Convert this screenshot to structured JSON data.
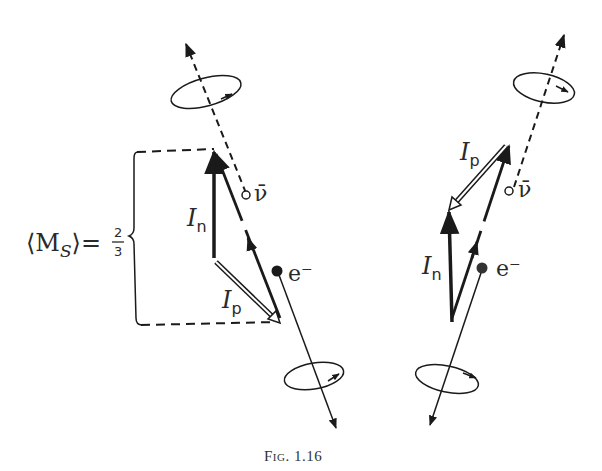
{
  "figure": {
    "caption": "Fig. 1.16",
    "ink_color": "#1a1a1a"
  },
  "left_panel": {
    "bracket_label": {
      "prefix": "⟨M",
      "subscript": "S",
      "suffix": "⟩=",
      "fraction_numerator": "2",
      "fraction_denominator": "3"
    },
    "neutron_label": {
      "symbol": "I",
      "subscript": "n"
    },
    "proton_label": {
      "symbol": "I",
      "subscript": "p"
    },
    "antineutrino_label": "ν̄",
    "electron_label": "e⁻"
  },
  "right_panel": {
    "neutron_label": {
      "symbol": "I",
      "subscript": "n"
    },
    "proton_label": {
      "symbol": "I",
      "subscript": "p"
    },
    "antineutrino_label": "ν̄",
    "electron_label": "e⁻"
  }
}
